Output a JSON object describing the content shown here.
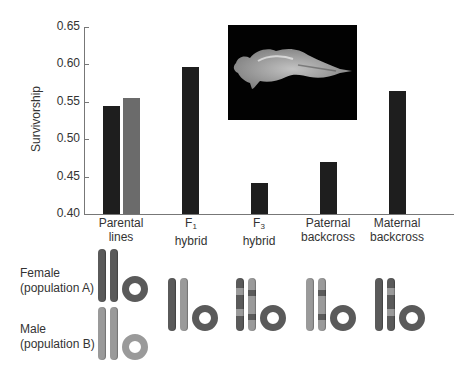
{
  "chart_data": {
    "type": "bar",
    "title": "",
    "xlabel": "",
    "ylabel": "Survivorship",
    "ylim": [
      0.4,
      0.65
    ],
    "yticks": [
      "0.40",
      "0.45",
      "0.50",
      "0.55",
      "0.60",
      "0.65"
    ],
    "grid": false,
    "categories": [
      "Parental lines",
      "F1 hybrid",
      "F3 hybrid",
      "Paternal backcross",
      "Maternal backcross"
    ],
    "series": [
      {
        "name": "Population A / cross",
        "color": "#1e1e1e",
        "values": [
          0.545,
          0.597,
          0.441,
          0.47,
          0.565
        ]
      },
      {
        "name": "Population B (parental)",
        "color": "#6b6b6b",
        "values": [
          0.555,
          null,
          null,
          null,
          null
        ]
      }
    ]
  },
  "axis": {
    "ylabel": "Survivorship",
    "ticks": [
      "0.65",
      "0.60",
      "0.55",
      "0.50",
      "0.45",
      "0.40"
    ]
  },
  "categories": [
    {
      "line1": "Parental",
      "line2": "lines",
      "sub": ""
    },
    {
      "line1": "F",
      "sub": "1",
      "line2": "hybrid"
    },
    {
      "line1": "F",
      "sub": "3",
      "line2": "hybrid"
    },
    {
      "line1": "Paternal",
      "line2": "backcross",
      "sub": ""
    },
    {
      "line1": "Maternal",
      "line2": "backcross",
      "sub": ""
    }
  ],
  "photo": {
    "description": "copepod-photo"
  },
  "rows": {
    "female": {
      "line1": "Female",
      "line2": "(population A)"
    },
    "male": {
      "line1": "Male",
      "line2": "(population B)"
    }
  },
  "colors": {
    "popA": "#5a5a5a",
    "popB": "#9a9a9a",
    "barDark": "#1e1e1e",
    "barGray": "#6b6b6b"
  }
}
